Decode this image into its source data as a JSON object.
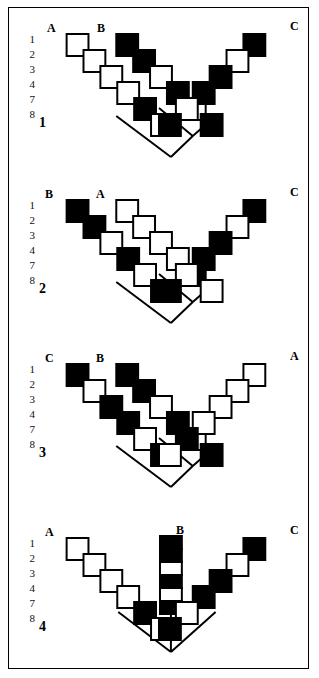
{
  "figure": {
    "row_labels": [
      "1",
      "2",
      "3",
      "4",
      "7",
      "8"
    ],
    "colors": {
      "apomorphic_fill": "#000000",
      "plesiomorphic_fill": "#ffffff",
      "stroke": "#000000",
      "frame": "#000000",
      "background": "#ffffff"
    },
    "legend": {
      "black_state": "derived (apomorphic) character state",
      "white_state": "primitive (plesiomorphic) character state"
    }
  },
  "panels": [
    {
      "number": "1",
      "topology": "dichotomous: (A,B),C",
      "branches": [
        {
          "taxon": "A",
          "label_x": 38,
          "label_y": 22,
          "orientation": "down-right",
          "states": [
            "white",
            "white",
            "white",
            "white",
            "black",
            "white"
          ]
        },
        {
          "taxon": "B",
          "label_x": 88,
          "label_y": 22,
          "orientation": "down-right",
          "states": [
            "black",
            "black",
            "white",
            "black",
            "white",
            "black"
          ]
        },
        {
          "taxon": "C",
          "label_x": 288,
          "label_y": 22,
          "orientation": "down-left",
          "states": [
            "black",
            "white",
            "black",
            "black",
            "white",
            "black"
          ]
        }
      ]
    },
    {
      "number": "2",
      "topology": "dichotomous: (B,A),C",
      "branches": [
        {
          "taxon": "B",
          "label_x": 38,
          "label_y": 22,
          "orientation": "down-right",
          "states": [
            "black",
            "black",
            "white",
            "black",
            "white",
            "black"
          ]
        },
        {
          "taxon": "A",
          "label_x": 88,
          "label_y": 22,
          "orientation": "down-right",
          "states": [
            "white",
            "white",
            "white",
            "white",
            "black",
            "white"
          ]
        },
        {
          "taxon": "C",
          "label_x": 288,
          "label_y": 22,
          "orientation": "down-left",
          "states": [
            "black",
            "white",
            "black",
            "black",
            "white",
            "black"
          ]
        }
      ]
    },
    {
      "number": "3",
      "topology": "dichotomous: (C,B),A",
      "branches": [
        {
          "taxon": "C",
          "label_x": 38,
          "label_y": 22,
          "orientation": "down-right",
          "states": [
            "black",
            "white",
            "black",
            "black",
            "white",
            "black"
          ]
        },
        {
          "taxon": "B",
          "label_x": 88,
          "label_y": 22,
          "orientation": "down-right",
          "states": [
            "black",
            "black",
            "white",
            "black",
            "white",
            "black"
          ]
        },
        {
          "taxon": "A",
          "label_x": 288,
          "label_y": 22,
          "orientation": "down-left",
          "states": [
            "white",
            "white",
            "white",
            "white",
            "black",
            "white"
          ]
        }
      ]
    },
    {
      "number": "4",
      "topology": "trichotomous (unresolved): A,B,C",
      "branches": [
        {
          "taxon": "A",
          "label_x": 38,
          "label_y": 18,
          "orientation": "down-right",
          "states": [
            "white",
            "white",
            "white",
            "white",
            "black",
            "white"
          ]
        },
        {
          "taxon": "B",
          "label_x": 168,
          "label_y": 18,
          "orientation": "vertical",
          "states": [
            "black",
            "black",
            "white",
            "black",
            "white",
            "black"
          ]
        },
        {
          "taxon": "C",
          "label_x": 288,
          "label_y": 18,
          "orientation": "down-left",
          "states": [
            "black",
            "white",
            "black",
            "black",
            "white",
            "black"
          ]
        }
      ]
    }
  ]
}
